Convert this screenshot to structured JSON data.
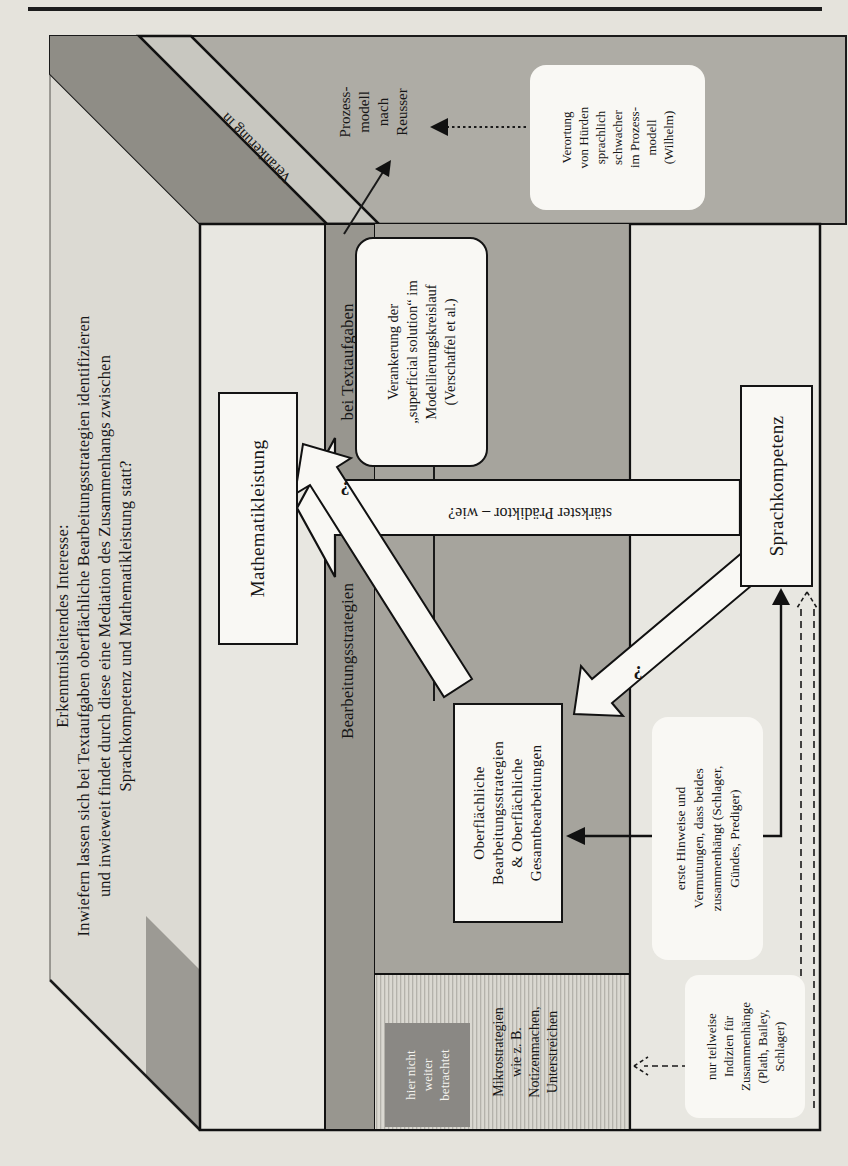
{
  "figure": {
    "title": {
      "lines": [
        "Erkenntnisleitendes Interesse:",
        "Inwiefern lassen sich bei Textaufgaben oberflächliche Bearbeitungsstrategien identifizieren",
        "und inwieweit findet durch diese eine Mediation des Zusammenhangs zwischen",
        "Sprachkompetenz und Mathematikleistung statt?"
      ]
    },
    "band": {
      "left_label": "Bearbeitungsstrategien",
      "right_label": "bei Textaufgaben",
      "top_label": "Verankerung in"
    },
    "nodes": {
      "mathematik": "Mathematikleistung",
      "sprach": "Sprachkompetenz",
      "oberflaechlich": {
        "lines": [
          "Oberflächliche",
          "Bearbeitungsstrategien",
          "& Oberflächliche",
          "Gesamtbearbeitungen"
        ]
      }
    },
    "side_panel": {
      "prozessmodell": {
        "lines": [
          "Prozess-",
          "modell",
          "nach",
          "Reusser"
        ]
      },
      "verortung": {
        "lines": [
          "Verortung",
          "von Hürden",
          "sprachlich",
          "schwacher",
          "im Prozess-",
          "modell",
          "(Wilhelm)"
        ]
      }
    },
    "annotations": {
      "superficial": {
        "lines": [
          "Verankerung der",
          "„superficial solution“ im",
          "Modellierungskreislauf",
          "(Verschaffel et al.)"
        ]
      },
      "erste_hinweise": {
        "lines": [
          "erste Hinweise und",
          "Vermutungen, dass beides",
          "zusammenhängt (Schlager,",
          "Gündes, Prediger)"
        ]
      },
      "nur_teilweise": {
        "lines": [
          "nur teilweise",
          "Indizien für",
          "Zusammenhänge",
          "(Plath, Bailey,",
          "Schlager)"
        ]
      },
      "mikrostrategien": {
        "lines": [
          "Mikrostrategien",
          "wie z. B.",
          "Notizenmachen,",
          "Unterstreichen"
        ]
      },
      "hier_nicht": {
        "lines": [
          "hier nicht",
          "weiter",
          "betrachtet"
        ]
      }
    },
    "arrows": {
      "main_label": "stärkster Prädiktor – wie?",
      "q_oberflaechlich_mathematik": "?",
      "q_sprach_oberflaechlich": "?"
    },
    "colors": {
      "front_face": "#e8e7e1",
      "top_face": "#dcdad3",
      "side_face": "#aeaca5",
      "side_face_dark": "#8f8d86",
      "band_diagonal": "#c8c7c0",
      "header_band": "#98968f",
      "interior": "#a6a49d",
      "hatch_zone": "#dad8d1",
      "muted_box": "#8a8884"
    }
  }
}
